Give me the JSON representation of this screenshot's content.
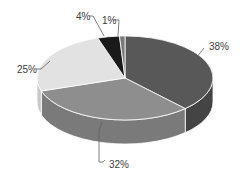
{
  "chart_data": {
    "type": "pie",
    "style": "3d",
    "title": "",
    "start_angle_deg": 90,
    "direction": "clockwise",
    "slices": [
      {
        "label": "38%",
        "value": 38,
        "color": "#585858",
        "side_color": "#444444"
      },
      {
        "label": "32%",
        "value": 32,
        "color": "#8e8e8e",
        "side_color": "#7a7a7a"
      },
      {
        "label": "25%",
        "value": 25,
        "color": "#e2e2e2",
        "side_color": "#c8c8c8"
      },
      {
        "label": "4%",
        "value": 4,
        "color": "#1a1a1a",
        "side_color": "#111111"
      },
      {
        "label": "1%",
        "value": 1,
        "color": "#7a7a7a",
        "side_color": "#666666"
      }
    ],
    "legend": null,
    "data_labels": [
      "38%",
      "32%",
      "25%",
      "4%",
      "1%"
    ]
  }
}
